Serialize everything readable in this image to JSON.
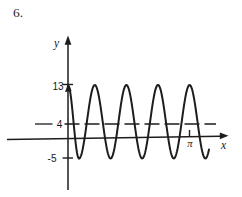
{
  "figure": {
    "item_number": "6.",
    "ink_color": "#1d1d1d",
    "background_color": "#ffffff"
  },
  "chart_data": {
    "type": "line",
    "curve_family": "sinusoid",
    "title": "",
    "xlabel": "x",
    "ylabel": "y",
    "x_tick_labels": [
      "π"
    ],
    "y_tick_labels": [
      "13",
      "4",
      "-5"
    ],
    "y_tick_values": [
      13,
      4,
      -5
    ],
    "maximum": 13,
    "minimum": -5,
    "midline": 4,
    "midline_style": "dashed",
    "amplitude": 9,
    "visible_crests": 5,
    "visible_troughs": 5,
    "visible_cycles": 4.5,
    "axis_arrows": {
      "x": "right",
      "y": "up"
    },
    "annotations": {
      "curve_left_end": "upward arrow on curve just right of the y-axis at the maximum level",
      "pi_alignment": "π tick on the x-axis lies beneath a crest"
    }
  }
}
